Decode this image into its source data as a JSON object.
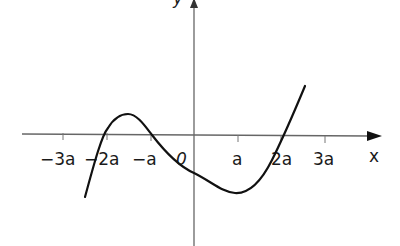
{
  "figure": {
    "type": "function-graph",
    "axes": {
      "x_label": "x",
      "y_label": "y",
      "x_ticks": [
        {
          "label": "−3a",
          "px": 63
        },
        {
          "label": "−2a",
          "px": 107
        },
        {
          "label": "−a",
          "px": 151
        },
        {
          "label": "0",
          "px": 194
        },
        {
          "label": "a",
          "px": 238
        },
        {
          "label": "2a",
          "px": 281
        },
        {
          "label": "3a",
          "px": 325
        }
      ]
    },
    "curve": {
      "description": "cubic-like curve with roots at -2a, -a and 2a; local maximum between -2a and -a above the axis, local minimum near x=a below the axis",
      "roots": [
        "−2a",
        "−a",
        "2a"
      ],
      "local_max_near": "−1.5a",
      "local_min_near": "a"
    },
    "colors": {
      "axis": "#555555",
      "curve": "#111111",
      "text": "#1a1a1a"
    }
  }
}
